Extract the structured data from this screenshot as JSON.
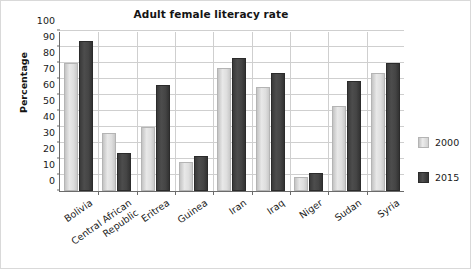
{
  "chart_data": {
    "type": "bar",
    "title": "Adult female literacy rate",
    "xlabel": "",
    "ylabel": "Percentage",
    "ylim": [
      0,
      100
    ],
    "ytick_step": 10,
    "yticks": [
      0,
      10,
      20,
      30,
      40,
      50,
      60,
      70,
      80,
      90,
      100
    ],
    "grid": true,
    "legend_position": "right",
    "categories": [
      "Bolivia",
      "Central African Republic",
      "Eritrea",
      "Guinea",
      "Iran",
      "Iraq",
      "Niger",
      "Sudan",
      "Syria"
    ],
    "category_lines": [
      [
        "Bolivia"
      ],
      [
        "Central African",
        "Republic"
      ],
      [
        "Eritrea"
      ],
      [
        "Guinea"
      ],
      [
        "Iran"
      ],
      [
        "Iraq"
      ],
      [
        "Niger"
      ],
      [
        "Sudan"
      ],
      [
        "Syria"
      ]
    ],
    "series": [
      {
        "name": "2000",
        "color": "#dedede",
        "values": [
          80,
          36,
          40,
          18,
          77,
          65,
          9,
          53,
          74
        ]
      },
      {
        "name": "2015",
        "color": "#444444",
        "values": [
          94,
          24,
          66,
          22,
          83,
          74,
          11,
          69,
          80
        ]
      }
    ]
  },
  "legend": {
    "items": [
      {
        "label": "2000",
        "swatch": "s2000"
      },
      {
        "label": "2015",
        "swatch": "s2015"
      }
    ]
  },
  "colors": {
    "series_2000": "#dedede",
    "series_2015": "#444444",
    "axis": "#6b6b6b",
    "grid": "#cfcfcf",
    "text": "#1a1a1a",
    "background": "#ffffff",
    "frame": "#d9d9d9"
  }
}
